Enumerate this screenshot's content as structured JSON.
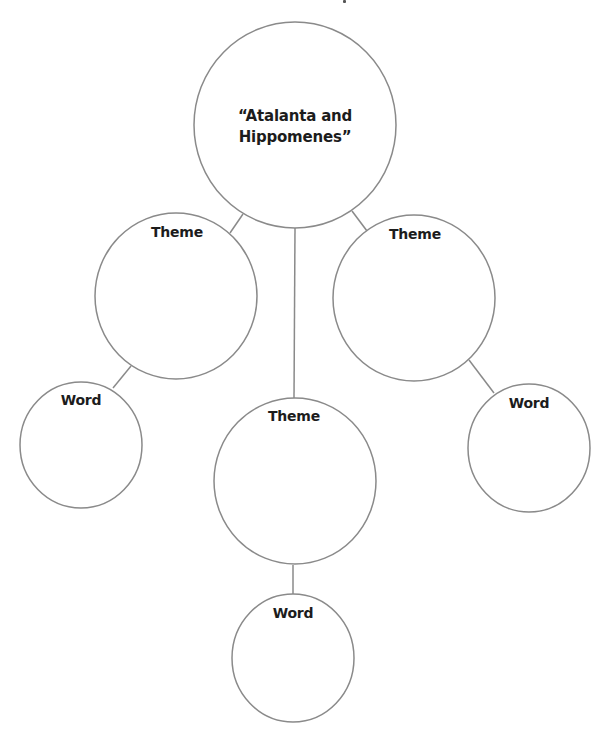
{
  "diagram": {
    "type": "concept-web",
    "colors": {
      "stroke": "#8a8a8a",
      "text": "#1c1c1c",
      "background": "#ffffff"
    },
    "center_node": {
      "label": "“Atalanta and\nHippomenes”"
    },
    "theme_nodes": [
      {
        "id": "theme-left",
        "label": "Theme"
      },
      {
        "id": "theme-center",
        "label": "Theme"
      },
      {
        "id": "theme-right",
        "label": "Theme"
      }
    ],
    "word_nodes": [
      {
        "id": "word-left",
        "label": "Word",
        "parent": "theme-left"
      },
      {
        "id": "word-center",
        "label": "Word",
        "parent": "theme-center"
      },
      {
        "id": "word-right",
        "label": "Word",
        "parent": "theme-right"
      }
    ]
  }
}
